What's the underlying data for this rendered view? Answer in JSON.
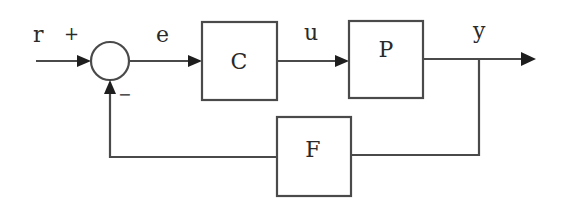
{
  "diagram": {
    "type": "feedback-control-block-diagram",
    "signals": {
      "reference": "r",
      "error": "e",
      "control": "u",
      "output": "y"
    },
    "summing_junction": {
      "plus_sign": "+",
      "minus_sign": "−"
    },
    "blocks": [
      {
        "id": "controller",
        "label": "C"
      },
      {
        "id": "plant",
        "label": "P"
      },
      {
        "id": "feedback",
        "label": "F"
      }
    ],
    "colors": {
      "line": "#4a4a4a",
      "arrow": "#1e1e1e",
      "text": "#2a2a2a",
      "background": "#ffffff"
    }
  }
}
